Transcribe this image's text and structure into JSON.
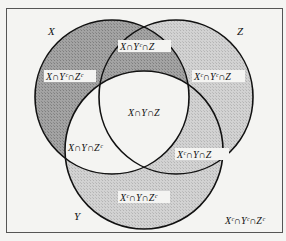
{
  "diagram": {
    "type": "venn",
    "sets": [
      {
        "name": "X",
        "label": "X"
      },
      {
        "name": "Y",
        "label": "Y"
      },
      {
        "name": "Z",
        "label": "Z"
      }
    ],
    "regions": {
      "x_only": "X∩Yᶜ∩Zᶜ",
      "x_z_not_y": "X∩Yᶜ∩Z",
      "z_only": "Xᶜ∩Yᶜ∩Z",
      "x_y_z": "X∩Y∩Z",
      "x_y_not_z": "X∩Y∩Zᶜ",
      "y_z_not_x": "Xᶜ∩Y∩Z",
      "y_only": "Xᶜ∩Y∩Zᶜ",
      "outside": "Xᶜ∩Yᶜ∩Zᶜ"
    },
    "colors": {
      "background": "#f4f4f2",
      "dark_shade": "#9a9a9a",
      "light_shade": "#cfcfcf",
      "center": "#f4f4f2",
      "stroke": "#111111"
    }
  }
}
